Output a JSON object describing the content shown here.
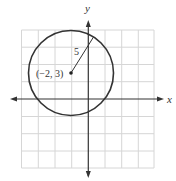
{
  "figure": {
    "type": "circle-on-coordinate-plane",
    "axes": {
      "x_label": "x",
      "y_label": "y"
    },
    "grid": {
      "cells_x": 8,
      "cells_y": 8,
      "units_per_cell": 2
    },
    "circle": {
      "center": [
        -2,
        3
      ],
      "radius": 5
    },
    "labels": {
      "center_label": "(−2, 3)",
      "radius_label": "5"
    },
    "colors": {
      "grid": "#d4d4d4",
      "axis": "#333333",
      "circle": "#333333",
      "text": "#333333"
    }
  }
}
